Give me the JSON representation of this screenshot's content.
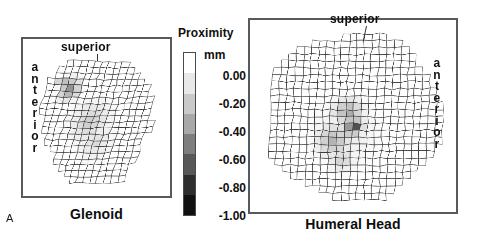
{
  "figure": {
    "panel_letter": "A"
  },
  "panels": [
    {
      "id": "glenoid",
      "caption": "Glenoid",
      "superior_label": "superior",
      "anterior_label": "anterior"
    },
    {
      "id": "humeral-head",
      "caption": "Humeral Head",
      "superior_label": "superior",
      "anterior_label": "anterior"
    }
  ],
  "colorbar": {
    "title": "Proximity",
    "unit": "mm",
    "tick_labels": [
      "0.00",
      "-0.20",
      "-0.40",
      "-0.60",
      "-0.80",
      "-1.00"
    ],
    "tick_values": [
      0.0,
      -0.2,
      -0.4,
      -0.6,
      -0.8,
      -1.0
    ],
    "band_colors": [
      "#ffffff",
      "#e8e8e8",
      "#c9c9c9",
      "#a8a8a8",
      "#7e7e7e",
      "#585858",
      "#2e2e2e",
      "#111111"
    ],
    "min_label": "-1.00",
    "max_label": "0.00",
    "orientation": "vertical"
  },
  "chart_data": {
    "type": "heatmap",
    "colorbar_label": "Proximity",
    "colorbar_unit": "mm",
    "zlim": [
      -1.0,
      0.0
    ],
    "colorscale": "grayscale-inverted",
    "maps": [
      {
        "name": "Glenoid",
        "grid_line_color": "#3a3a3a",
        "orientation": {
          "top": "superior",
          "left": "anterior"
        },
        "grid": {
          "cols": 17,
          "rows": 21
        },
        "mask_shape": "pear-outline-tilted",
        "hotspots": [
          {
            "label": "superior-anterior dark cell",
            "col_frac": 0.12,
            "row_frac": 0.22,
            "value": -0.95,
            "radius_frac": 0.05
          },
          {
            "label": "superior-anterior band",
            "col_frac": 0.2,
            "row_frac": 0.27,
            "value": -0.5,
            "radius_frac": 0.14
          },
          {
            "label": "central mid region",
            "col_frac": 0.45,
            "row_frac": 0.52,
            "value": -0.24,
            "radius_frac": 0.26
          },
          {
            "label": "inferior shading",
            "col_frac": 0.55,
            "row_frac": 0.68,
            "value": -0.16,
            "radius_frac": 0.22
          }
        ]
      },
      {
        "name": "Humeral Head",
        "grid_line_color": "#3a3a3a",
        "orientation": {
          "top": "superior",
          "right": "anterior"
        },
        "grid": {
          "cols": 24,
          "rows": 24
        },
        "mask_shape": "round-disc",
        "hotspots": [
          {
            "label": "central dark core",
            "col_frac": 0.52,
            "row_frac": 0.57,
            "value": -0.98,
            "radius_frac": 0.045
          },
          {
            "label": "core surround",
            "col_frac": 0.5,
            "row_frac": 0.56,
            "value": -0.62,
            "radius_frac": 0.1
          },
          {
            "label": "upper contact lobe",
            "col_frac": 0.47,
            "row_frac": 0.47,
            "value": -0.4,
            "radius_frac": 0.13
          },
          {
            "label": "lower-left contact lobe",
            "col_frac": 0.4,
            "row_frac": 0.64,
            "value": -0.34,
            "radius_frac": 0.16
          },
          {
            "label": "inferior tail",
            "col_frac": 0.45,
            "row_frac": 0.76,
            "value": -0.22,
            "radius_frac": 0.12
          },
          {
            "label": "broad diffuse region",
            "col_frac": 0.46,
            "row_frac": 0.6,
            "value": -0.12,
            "radius_frac": 0.28
          }
        ]
      }
    ]
  }
}
